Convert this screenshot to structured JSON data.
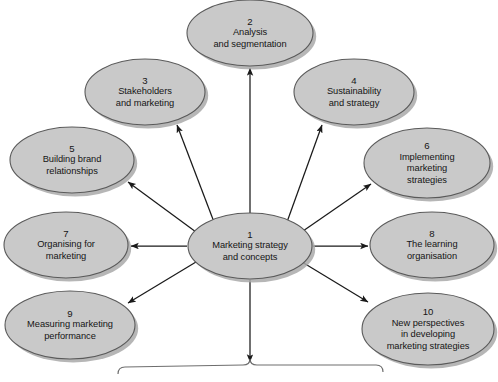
{
  "diagram": {
    "type": "hub-and-spoke-ellipse-diagram",
    "style": {
      "ellipse_fill": "#c9c9c9",
      "ellipse_stroke": "#5a5a5a",
      "ellipse_shadow": "#a9a9a9",
      "arrow_color": "#1a1a1a",
      "brace_color": "#6e6e6e",
      "background": "#ffffff",
      "text_color": "#151515"
    },
    "center": {
      "id": "node-1",
      "number": "1",
      "lines": [
        "Marketing strategy",
        "and concepts"
      ],
      "cx": 250,
      "cy": 246,
      "rx": 62,
      "ry": 33
    },
    "nodes": [
      {
        "id": "node-2",
        "number": "2",
        "lines": [
          "Analysis",
          "and segmentation"
        ],
        "cx": 250,
        "cy": 33,
        "rx": 63,
        "ry": 33,
        "arrow": {
          "x1": 250,
          "y1": 213,
          "x2": 250,
          "y2": 68
        }
      },
      {
        "id": "node-3",
        "number": "3",
        "lines": [
          "Stakeholders",
          "and marketing"
        ],
        "cx": 145,
        "cy": 92,
        "rx": 60,
        "ry": 33,
        "arrow": {
          "x1": 214,
          "y1": 222,
          "x2": 177,
          "y2": 125
        }
      },
      {
        "id": "node-4",
        "number": "4",
        "lines": [
          "Sustainability",
          "and strategy"
        ],
        "cx": 354,
        "cy": 92,
        "rx": 60,
        "ry": 33,
        "arrow": {
          "x1": 287,
          "y1": 222,
          "x2": 322,
          "y2": 125
        }
      },
      {
        "id": "node-5",
        "number": "5",
        "lines": [
          "Building brand",
          "relationships"
        ],
        "cx": 72,
        "cy": 160,
        "rx": 62,
        "ry": 33,
        "arrow": {
          "x1": 196,
          "y1": 232,
          "x2": 128,
          "y2": 182
        }
      },
      {
        "id": "node-6",
        "number": "6",
        "lines": [
          "Implementing",
          "marketing",
          "strategies"
        ],
        "cx": 427,
        "cy": 163,
        "rx": 63,
        "ry": 35,
        "arrow": {
          "x1": 303,
          "y1": 231,
          "x2": 371,
          "y2": 184
        }
      },
      {
        "id": "node-7",
        "number": "7",
        "lines": [
          "Organising for",
          "marketing"
        ],
        "cx": 66,
        "cy": 245,
        "rx": 62,
        "ry": 33,
        "arrow": {
          "x1": 187,
          "y1": 246,
          "x2": 131,
          "y2": 246
        }
      },
      {
        "id": "node-8",
        "number": "8",
        "lines": [
          "The learning",
          "organisation"
        ],
        "cx": 432,
        "cy": 245,
        "rx": 62,
        "ry": 33,
        "arrow": {
          "x1": 313,
          "y1": 246,
          "x2": 368,
          "y2": 246
        }
      },
      {
        "id": "node-9",
        "number": "9",
        "lines": [
          "Measuring marketing",
          "performance"
        ],
        "cx": 70,
        "cy": 325,
        "rx": 65,
        "ry": 34,
        "arrow": {
          "x1": 196,
          "y1": 262,
          "x2": 128,
          "y2": 303
        }
      },
      {
        "id": "node-10",
        "number": "10",
        "lines": [
          "New perspectives",
          "in developing",
          "marketing strategies"
        ],
        "cx": 428,
        "cy": 329,
        "rx": 66,
        "ry": 36,
        "arrow": {
          "x1": 302,
          "y1": 262,
          "x2": 368,
          "y2": 302
        }
      }
    ],
    "bottom_arrow": {
      "x1": 250,
      "y1": 280,
      "x2": 250,
      "y2": 362
    },
    "brace": {
      "left": 118,
      "right": 383,
      "y": 372,
      "tip_x": 250
    }
  }
}
